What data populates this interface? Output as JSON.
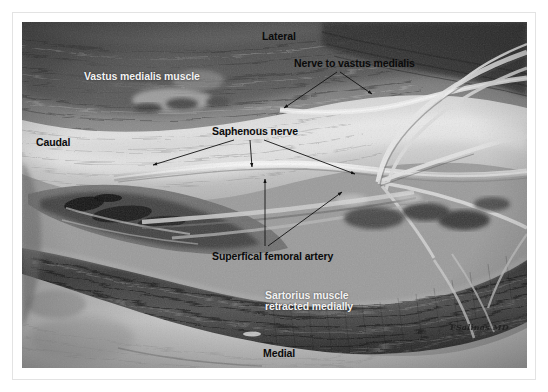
{
  "document": {
    "type": "anatomical-dissection-photograph",
    "color_mode": "grayscale",
    "caption_signature": "FSalinas MD"
  },
  "photo": {
    "subject": "Adductor canal dissection of the thigh showing the saphenous nerve, nerve to vastus medialis and superficial femoral artery",
    "frame": {
      "x": 22,
      "y": 22,
      "width": 505,
      "height": 346
    }
  },
  "orientation_labels": [
    {
      "id": "lateral",
      "text": "Lateral",
      "style": "dark",
      "x": 240,
      "y": 9
    },
    {
      "id": "medial",
      "text": "Medial",
      "style": "dark",
      "x": 241,
      "y": 326
    },
    {
      "id": "caudal",
      "text": "Caudal",
      "style": "dark",
      "x": 14,
      "y": 115
    }
  ],
  "structure_labels": [
    {
      "id": "vastus-medialis-muscle",
      "text": "Vastus medialis muscle",
      "style": "light",
      "x": 62,
      "y": 49
    },
    {
      "id": "nerve-to-vastus-medialis",
      "text": "Nerve to vastus medialis",
      "style": "dark",
      "x": 272,
      "y": 36
    },
    {
      "id": "saphenous-nerve",
      "text": "Saphenous nerve",
      "style": "dark",
      "x": 190,
      "y": 104
    },
    {
      "id": "superficial-femoral-artery",
      "text": "Superfical femoral artery",
      "style": "dark",
      "x": 190,
      "y": 229
    },
    {
      "id": "sartorius-muscle",
      "text": "Sartorius muscle",
      "style": "light",
      "x": 243,
      "y": 268
    },
    {
      "id": "sartorius-retracted",
      "text": "retracted medially",
      "style": "light",
      "x": 243,
      "y": 279
    }
  ],
  "leader_arrows": [
    {
      "id": "arrow-nerve-vm-left",
      "from": [
        315,
        50
      ],
      "to": [
        262,
        86
      ]
    },
    {
      "id": "arrow-nerve-vm-right",
      "from": [
        318,
        50
      ],
      "to": [
        350,
        72
      ]
    },
    {
      "id": "arrow-saph-left",
      "from": [
        212,
        118
      ],
      "to": [
        131,
        143
      ]
    },
    {
      "id": "arrow-saph-center",
      "from": [
        228,
        118
      ],
      "to": [
        230,
        145
      ]
    },
    {
      "id": "arrow-saph-right",
      "from": [
        242,
        118
      ],
      "to": [
        333,
        152
      ]
    },
    {
      "id": "arrow-sfa-up",
      "from": [
        243,
        224
      ],
      "to": [
        243,
        157
      ]
    },
    {
      "id": "arrow-sfa-diagonal",
      "from": [
        246,
        224
      ],
      "to": [
        320,
        170
      ]
    }
  ],
  "colors": {
    "page_background": "#ffffff",
    "page_border": "#e3e3e3",
    "label_dark": "#0b0b0b",
    "label_light": "#f2f2f2",
    "arrow": "#121212"
  }
}
